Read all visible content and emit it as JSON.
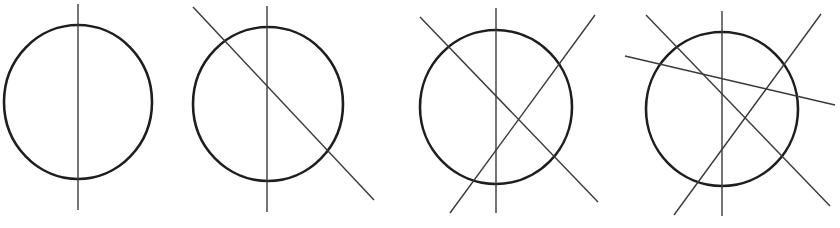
{
  "diagram": {
    "colors": {
      "background": "#ffffff",
      "circle_stroke": "#1e1e1e",
      "line_stroke": "#3a3a3a"
    },
    "panels": [
      {
        "id": "panel-1",
        "line_count": 1,
        "circle": {
          "cx": 78,
          "cy": 102,
          "rx": 74,
          "ry": 77
        },
        "lines": [
          {
            "name": "vertical",
            "x1": 78,
            "y1": 4,
            "x2": 78,
            "y2": 210
          }
        ]
      },
      {
        "id": "panel-2",
        "line_count": 2,
        "circle": {
          "cx": 268,
          "cy": 104,
          "rx": 75,
          "ry": 77
        },
        "lines": [
          {
            "name": "vertical",
            "x1": 267,
            "y1": 6,
            "x2": 267,
            "y2": 212
          },
          {
            "name": "diagonal-down",
            "x1": 193,
            "y1": 7,
            "x2": 374,
            "y2": 200
          }
        ]
      },
      {
        "id": "panel-3",
        "line_count": 3,
        "circle": {
          "cx": 496,
          "cy": 107,
          "rx": 76,
          "ry": 77
        },
        "lines": [
          {
            "name": "vertical",
            "x1": 496,
            "y1": 8,
            "x2": 496,
            "y2": 213
          },
          {
            "name": "diagonal-down",
            "x1": 420,
            "y1": 17,
            "x2": 598,
            "y2": 202
          },
          {
            "name": "diagonal-up",
            "x1": 450,
            "y1": 213,
            "x2": 595,
            "y2": 15
          }
        ]
      },
      {
        "id": "panel-4",
        "line_count": 4,
        "circle": {
          "cx": 722,
          "cy": 109,
          "rx": 76,
          "ry": 77
        },
        "lines": [
          {
            "name": "vertical",
            "x1": 722,
            "y1": 11,
            "x2": 722,
            "y2": 216
          },
          {
            "name": "diagonal-down",
            "x1": 646,
            "y1": 15,
            "x2": 830,
            "y2": 206
          },
          {
            "name": "diagonal-up",
            "x1": 674,
            "y1": 215,
            "x2": 821,
            "y2": 14
          },
          {
            "name": "near-horizontal",
            "x1": 625,
            "y1": 56,
            "x2": 835,
            "y2": 105
          }
        ]
      }
    ]
  }
}
